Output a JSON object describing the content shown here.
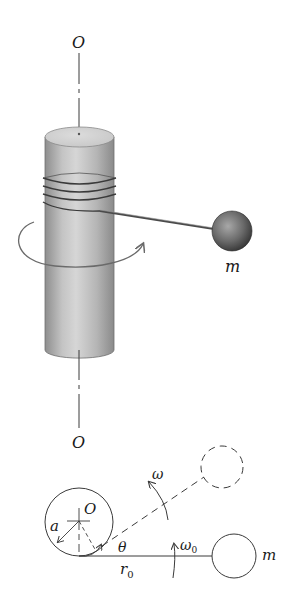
{
  "figure": {
    "top_view": {
      "axis_top_label": "O",
      "axis_bottom_label": "O",
      "mass_label": "m"
    },
    "plan_view": {
      "center_label": "O",
      "radius_label": "a",
      "angle_label": "θ",
      "length_label": "r",
      "length_subscript": "0",
      "omega_label": "ω",
      "omega0_label": "ω",
      "omega0_subscript": "0",
      "mass_label": "m"
    },
    "colors": {
      "line": "#3a3a3a",
      "cylinder_light": "#d8d8d8",
      "cylinder_dark": "#8a8a8a",
      "ball_dark": "#3c3c3c",
      "arrow": "#6a6a6a"
    }
  }
}
